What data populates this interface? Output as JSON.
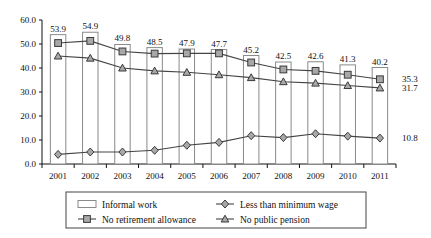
{
  "chart_data": {
    "type": "bar",
    "title": "",
    "xlabel": "",
    "ylabel": "",
    "ylim": [
      0.0,
      60.0
    ],
    "ytick_labels": [
      "0.0",
      "10.0",
      "20.0",
      "30.0",
      "40.0",
      "50.0",
      "60.0"
    ],
    "yticks": [
      0,
      10,
      20,
      30,
      40,
      50,
      60
    ],
    "grid": false,
    "legend_position": "bottom",
    "categories": [
      "2001",
      "2002",
      "2003",
      "2004",
      "2005",
      "2006",
      "2007",
      "2008",
      "2009",
      "2010",
      "2011"
    ],
    "series": [
      {
        "name": "Informal work",
        "kind": "bar",
        "marker": "bar",
        "values": [
          53.9,
          54.9,
          49.8,
          48.5,
          47.9,
          47.7,
          45.2,
          42.5,
          42.6,
          41.3,
          40.2
        ],
        "labels": [
          "53.9",
          "54.9",
          "49.8",
          "48.5",
          "47.9",
          "47.7",
          "45.2",
          "42.5",
          "42.6",
          "41.3",
          "40.2"
        ],
        "end_label": "40.2"
      },
      {
        "name": "No retirement allowance",
        "kind": "line",
        "marker": "square",
        "values": [
          50.4,
          51.3,
          46.9,
          46.0,
          46.1,
          46.1,
          42.3,
          39.4,
          38.8,
          37.2,
          35.3
        ],
        "end_label": "35.3"
      },
      {
        "name": "No public pension",
        "kind": "line",
        "marker": "triangle",
        "values": [
          45.0,
          44.1,
          40.0,
          38.8,
          38.2,
          37.2,
          36.0,
          34.3,
          33.7,
          32.7,
          31.7
        ],
        "end_label": "31.7"
      },
      {
        "name": "Less than minimum wage",
        "kind": "line",
        "marker": "diamond",
        "values": [
          4.0,
          5.0,
          5.0,
          5.7,
          7.8,
          9.0,
          11.8,
          11.0,
          12.6,
          11.6,
          10.8
        ],
        "end_label": "10.8"
      }
    ],
    "legend_entries": [
      {
        "label": "Informal work",
        "marker": "bar"
      },
      {
        "label": "Less than minimum wage",
        "marker": "diamond"
      },
      {
        "label": "No retirement allowance",
        "marker": "square"
      },
      {
        "label": "No public pension",
        "marker": "triangle"
      }
    ],
    "colors": {
      "bar_fill": "#ffffff",
      "bar_stroke": "#8a8a8a",
      "line": "#444444",
      "marker_fill": "#a8a8a8",
      "marker_stroke": "#3a3a3a",
      "text": "#111111"
    }
  }
}
